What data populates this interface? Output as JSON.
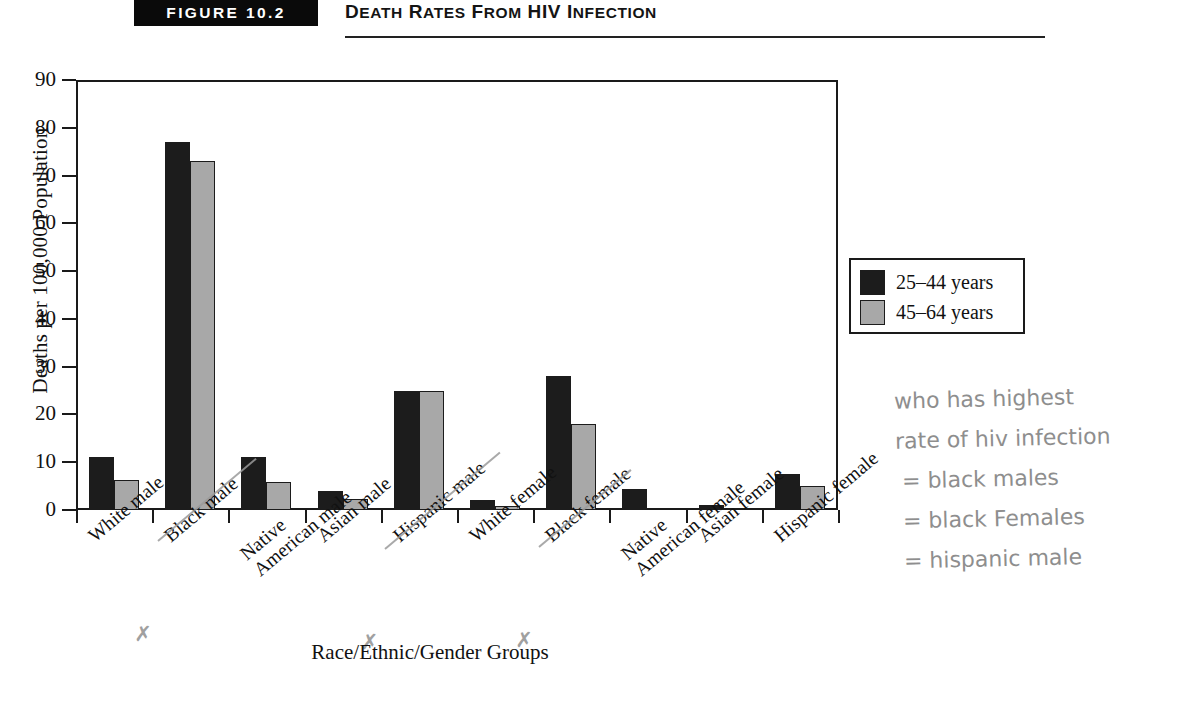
{
  "header": {
    "figure_badge": "FIGURE 10.2",
    "title_words": [
      "Death",
      "Rates",
      "from",
      "HIV",
      "Infection"
    ],
    "title_plain": "Death Rates from HIV Infection"
  },
  "legend": {
    "items": [
      {
        "label": "25–44 years",
        "color": "#1c1c1c"
      },
      {
        "label": "45–64 years",
        "color": "#a8a8a8"
      }
    ]
  },
  "annotation": {
    "lines": [
      "who has highest",
      "rate of hiv infection",
      "=  black males",
      "=  black Females",
      "=  hispanic male"
    ],
    "color": "#8e8e8e",
    "marked_labels": [
      "Black male",
      "Hispanic male",
      "Black female"
    ]
  },
  "chart_data": {
    "type": "bar",
    "title": "Death Rates from HIV Infection",
    "xlabel": "Race/Ethnic/Gender Groups",
    "ylabel": "Deaths per 100,000 Population",
    "ylim": [
      0,
      90
    ],
    "yticks": [
      0,
      10,
      20,
      30,
      40,
      50,
      60,
      70,
      80,
      90
    ],
    "grid": false,
    "legend_position": "right",
    "categories": [
      "White male",
      "Black male",
      "Native American male",
      "Asian male",
      "Hispanic male",
      "White female",
      "Black female",
      "Native American female",
      "Asian female",
      "Hispanic female"
    ],
    "category_lines": [
      [
        "White male"
      ],
      [
        "Black male"
      ],
      [
        "Native",
        "American male"
      ],
      [
        "Asian male"
      ],
      [
        "Hispanic male"
      ],
      [
        "White female"
      ],
      [
        "Black female"
      ],
      [
        "Native",
        "American female"
      ],
      [
        "Asian female"
      ],
      [
        "Hispanic female"
      ]
    ],
    "series": [
      {
        "name": "25–44 years",
        "color": "#1c1c1c",
        "values": [
          11,
          77,
          11,
          4,
          25,
          2,
          28,
          4.5,
          1,
          7.5
        ]
      },
      {
        "name": "45–64 years",
        "color": "#a8a8a8",
        "values": [
          6.3,
          73,
          5.8,
          2.3,
          25,
          0.8,
          18,
          0,
          0,
          5
        ]
      }
    ]
  }
}
